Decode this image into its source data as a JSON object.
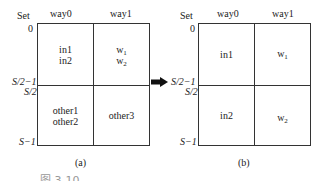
{
  "diagram_a": {
    "header": {
      "set": "Set",
      "way0": "way0",
      "way1": "way1"
    },
    "row_labels": {
      "top": "0",
      "mid_upper": "S/2−1",
      "mid_lower": "S/2",
      "bottom": "S−1"
    },
    "cells": {
      "top_way0": [
        "in1",
        "in2"
      ],
      "top_way1": [
        {
          "base": "w",
          "sub": "1"
        },
        {
          "base": "w",
          "sub": "2"
        }
      ],
      "bottom_way0": [
        "other1",
        "other2"
      ],
      "bottom_way1": [
        "other3"
      ]
    },
    "caption": "(a)"
  },
  "arrow": {
    "icon": "right-arrow-icon",
    "color": "#111111"
  },
  "diagram_b": {
    "header": {
      "set": "Set",
      "way0": "way0",
      "way1": "way1"
    },
    "row_labels": {
      "top": "0",
      "mid_upper": "S/2−1",
      "mid_lower": "S/2",
      "bottom": "S−1"
    },
    "cells": {
      "top_way0": [
        "in1"
      ],
      "top_way1": [
        {
          "base": "w",
          "sub": "1"
        }
      ],
      "bottom_way0": [
        "in2"
      ],
      "bottom_way1": [
        {
          "base": "w",
          "sub": "2"
        }
      ]
    },
    "caption": "(b)"
  },
  "figure_caption": "图 3-10  ……"
}
